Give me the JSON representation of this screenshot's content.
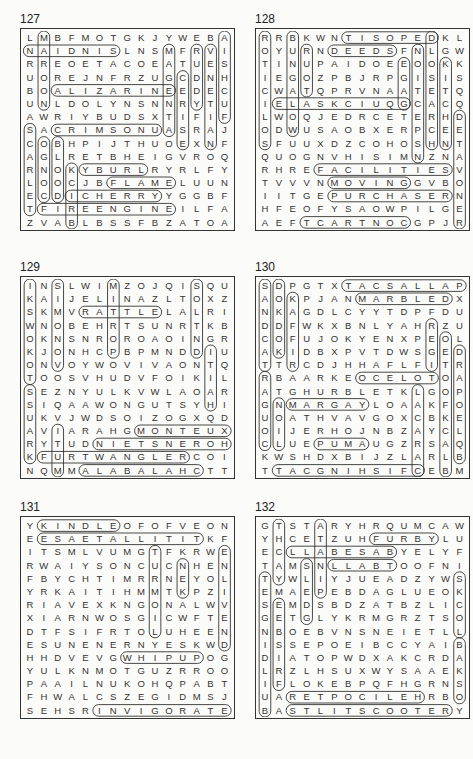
{
  "puzzles": [
    {
      "number": "127",
      "grid": [
        "LMBFMOTGKJYWEBA",
        "NAIDNISLNSMFRVI",
        "RREOETACOEATUES",
        "UOREJNFRZUGCDNH",
        "BOALIZARINEEDEC",
        "UNLDOLYNSNNRYTU",
        "AWRIYBUDSXTIFIF",
        "SACRIMSONUASRAJ",
        "COBHPIJTHUOEXNF",
        "AGLRETBHEIGVROQ",
        "RNOKYBURLRYRLFY",
        "LOOCJBFLAMELUUN",
        "ECDICHERRYYGGBF",
        "TFIREENGINEILFA",
        "ZVABLBSSFBZATOA"
      ],
      "words": [
        {
          "r1": 1,
          "c1": 0,
          "r2": 1,
          "c2": 6
        },
        {
          "r1": 4,
          "c1": 2,
          "r2": 4,
          "c2": 10
        },
        {
          "r1": 7,
          "c1": 2,
          "r2": 7,
          "c2": 9
        },
        {
          "r1": 12,
          "c1": 3,
          "r2": 12,
          "c2": 9
        },
        {
          "r1": 11,
          "c1": 6,
          "r2": 11,
          "c2": 10
        },
        {
          "r1": 13,
          "c1": 1,
          "r2": 13,
          "c2": 10
        },
        {
          "r1": 10,
          "c1": 4,
          "r2": 10,
          "c2": 8
        },
        {
          "r1": 0,
          "c1": 1,
          "r2": 5,
          "c2": 1
        },
        {
          "r1": 1,
          "c1": 10,
          "r2": 7,
          "c2": 10
        },
        {
          "r1": 1,
          "c1": 12,
          "r2": 5,
          "c2": 12
        },
        {
          "r1": 1,
          "c1": 13,
          "r2": 8,
          "c2": 13
        },
        {
          "r1": 0,
          "c1": 14,
          "r2": 6,
          "c2": 14
        },
        {
          "r1": 7,
          "c1": 0,
          "r2": 13,
          "c2": 0
        },
        {
          "r1": 8,
          "c1": 2,
          "r2": 12,
          "c2": 2
        },
        {
          "r1": 10,
          "c1": 3,
          "r2": 14,
          "c2": 3
        },
        {
          "r1": 3,
          "c1": 11,
          "r2": 8,
          "c2": 11
        },
        {
          "r1": 8,
          "c1": 1,
          "r2": 12,
          "c2": 1
        }
      ]
    },
    {
      "number": "128",
      "grid": [
        "RRBKWNTISOPEDKL",
        "OYURNDEEDSFNLGW",
        "TINUPAIDOEEOOKK",
        "IEGOZPBJRPGISIS",
        "CWATQPRVNAATETQ",
        "IELASKCIUQGCACQ",
        "LWOQJEDRCETERHD",
        "ODWUSAOBXERPCEE",
        "SFUUXDZCOHOSHNT",
        "QUOGNVHISIMNZNA",
        "RHREFACILITIESV",
        "TVVVNMOVINGGVBO",
        "IITGEPURCHASERN",
        "HFEOFYSAOWPILGE",
        "AEFTCARTNOCGPJR"
      ],
      "words": [
        {
          "r1": 0,
          "c1": 6,
          "r2": 0,
          "c2": 12
        },
        {
          "r1": 1,
          "c1": 5,
          "r2": 1,
          "c2": 9
        },
        {
          "r1": 5,
          "c1": 1,
          "r2": 5,
          "c2": 10
        },
        {
          "r1": 10,
          "c1": 4,
          "r2": 10,
          "c2": 13
        },
        {
          "r1": 11,
          "c1": 5,
          "r2": 11,
          "c2": 10
        },
        {
          "r1": 12,
          "c1": 5,
          "r2": 12,
          "c2": 13
        },
        {
          "r1": 14,
          "c1": 3,
          "r2": 14,
          "c2": 10
        },
        {
          "r1": 0,
          "c1": 0,
          "r2": 8,
          "c2": 0
        },
        {
          "r1": 0,
          "c1": 2,
          "r2": 7,
          "c2": 2
        },
        {
          "r1": 1,
          "c1": 3,
          "r2": 4,
          "c2": 3
        },
        {
          "r1": 1,
          "c1": 11,
          "r2": 9,
          "c2": 11
        },
        {
          "r1": 0,
          "c1": 12,
          "r2": 8,
          "c2": 12
        },
        {
          "r1": 2,
          "c1": 13,
          "r2": 8,
          "c2": 13
        },
        {
          "r1": 6,
          "c1": 14,
          "r2": 14,
          "c2": 14
        },
        {
          "r1": 2,
          "c1": 10,
          "r2": 5,
          "c2": 10
        }
      ]
    },
    {
      "number": "129",
      "grid": [
        "INSLWIMZOJQISQU",
        "KAIJELINAZLTOXZ",
        "SKMVRATTLELALRI",
        "WNOBEHRTSUNRTKB",
        "OKNSNROROAOINGR",
        "KJONHCPBPMNDDIU",
        "ONVOYWOVIVAONTQ",
        "TOOSVHUDVFOIKIL",
        "SEZNYULKVWLAOAR",
        "SIQAAWONGUTSYHI",
        "UKVJWDSOIZOGXQD",
        "AVIARAHGMONTEUX",
        "RYTUDNIETSNEROH",
        "KFURTWANGLERCOI",
        "NQMMALABALAHCTT"
      ],
      "words": [
        {
          "r1": 2,
          "c1": 4,
          "r2": 2,
          "c2": 9
        },
        {
          "r1": 11,
          "c1": 8,
          "r2": 11,
          "c2": 14
        },
        {
          "r1": 12,
          "c1": 5,
          "r2": 12,
          "c2": 14
        },
        {
          "r1": 13,
          "c1": 1,
          "r2": 13,
          "c2": 11
        },
        {
          "r1": 14,
          "c1": 4,
          "r2": 14,
          "c2": 12
        },
        {
          "r1": 0,
          "c1": 0,
          "r2": 7,
          "c2": 0
        },
        {
          "r1": 0,
          "c1": 6,
          "r2": 5,
          "c2": 6
        },
        {
          "r1": 0,
          "c1": 12,
          "r2": 5,
          "c2": 12
        },
        {
          "r1": 0,
          "c1": 2,
          "r2": 6,
          "c2": 2
        },
        {
          "r1": 11,
          "c1": 2,
          "r2": 14,
          "c2": 2
        },
        {
          "r1": 5,
          "c1": 13,
          "r2": 9,
          "c2": 13
        },
        {
          "r1": 8,
          "c1": 0,
          "r2": 13,
          "c2": 0
        }
      ]
    },
    {
      "number": "130",
      "grid": [
        "SDPGTXTACSALLAP",
        "AOKPJANMARBLEDX",
        "NKAGDLCYYTDPFDU",
        "DDFWKXBNLYAHRZU",
        "COFUJOKYENXPEOL",
        "AKIDBXPVTDWSGED",
        "TTRCDJHHAFLFITR",
        "RBAARKEOCELOTOA",
        "ATGHURBLETKLGOP",
        "GNMARGAYLOAAKFO",
        "UOATHVAVGOXCBKE",
        "OIJERHOJNBZAYCL",
        "CLUEPUMAUGZRSAQ",
        "KWSHDXBIJZLARLB",
        "TTACGNIHSIFCEBM"
      ],
      "words": [
        {
          "r1": 0,
          "c1": 6,
          "r2": 0,
          "c2": 14
        },
        {
          "r1": 1,
          "c1": 7,
          "r2": 1,
          "c2": 13
        },
        {
          "r1": 7,
          "c1": 7,
          "r2": 7,
          "c2": 12
        },
        {
          "r1": 9,
          "c1": 2,
          "r2": 9,
          "c2": 7
        },
        {
          "r1": 12,
          "c1": 4,
          "r2": 12,
          "c2": 7
        },
        {
          "r1": 14,
          "c1": 1,
          "r2": 14,
          "c2": 11
        },
        {
          "r1": 0,
          "c1": 0,
          "r2": 6,
          "c2": 0
        },
        {
          "r1": 0,
          "c1": 1,
          "r2": 5,
          "c2": 1
        },
        {
          "r1": 1,
          "c1": 2,
          "r2": 6,
          "c2": 2
        },
        {
          "r1": 7,
          "c1": 0,
          "r2": 12,
          "c2": 0
        },
        {
          "r1": 9,
          "c1": 1,
          "r2": 12,
          "c2": 1
        },
        {
          "r1": 3,
          "c1": 12,
          "r2": 6,
          "c2": 12
        },
        {
          "r1": 4,
          "c1": 13,
          "r2": 14,
          "c2": 13
        },
        {
          "r1": 5,
          "c1": 14,
          "r2": 13,
          "c2": 14
        },
        {
          "r1": 8,
          "c1": 11,
          "r2": 14,
          "c2": 11
        }
      ]
    },
    {
      "number": "131",
      "grid": [
        "YKINDLEOFOFVEON",
        "EESAETALLITITKF",
        "ITSMLVUMGTFKRWE",
        "RWAIYSONCUCNHEN",
        "FBYCHTIMRRNEYOL",
        "YRKAITIHMMTKPZI",
        "RIAVEXKNGONALWV",
        "XIARNWOSGICWFTE",
        "DTFSIFRTOLUHEEN",
        "ESUNENERNYESKWD",
        "HHDVEVGWHIPUPOG",
        "YULKNMOTGUZRROO",
        "PAAILNUKOHQPABT",
        "FHWALCSZEGIDMSJ",
        "SEHSRINVIGORATE"
      ],
      "words": [
        {
          "r1": 0,
          "c1": 1,
          "r2": 0,
          "c2": 6
        },
        {
          "r1": 1,
          "c1": 1,
          "r2": 1,
          "c2": 12
        },
        {
          "r1": 10,
          "c1": 7,
          "r2": 10,
          "c2": 12
        },
        {
          "r1": 14,
          "c1": 5,
          "r2": 14,
          "c2": 14
        },
        {
          "r1": 2,
          "c1": 14,
          "r2": 9,
          "c2": 14
        },
        {
          "r1": 2,
          "c1": 9,
          "r2": 8,
          "c2": 9
        },
        {
          "r1": 3,
          "c1": 11,
          "r2": 5,
          "c2": 11
        }
      ]
    },
    {
      "number": "132",
      "grid": [
        "GTSTARYHRQUMCAW",
        "YHCETZUHFURBYLU",
        "ECLLABESABYELYF",
        "TAMSNLLABTOOFNI",
        "TYWLIYJUEADZYWS",
        "EMAEPEBDAGLUEOK",
        "SEMDSBDZATBZLIC",
        "GETGLYKRMGRZTSO",
        "NBOEBVNSNEIETLL",
        "ISSEPOEIBCCYAIB",
        "DIATOPWDXAKCRDA",
        "LRZLHSUXWYSAAEK",
        "IFLOKEBPQFHGRNS",
        "UARETPOCILEHRBO",
        "BASTLITSCOOTERY"
      ],
      "words": [
        {
          "r1": 1,
          "c1": 8,
          "r2": 1,
          "c2": 12
        },
        {
          "r1": 2,
          "c1": 2,
          "r2": 2,
          "c2": 9
        },
        {
          "r1": 3,
          "c1": 5,
          "r2": 3,
          "c2": 9
        },
        {
          "r1": 13,
          "c1": 2,
          "r2": 13,
          "c2": 11
        },
        {
          "r1": 14,
          "c1": 2,
          "r2": 14,
          "c2": 13
        },
        {
          "r1": 0,
          "c1": 1,
          "r2": 4,
          "c2": 1
        },
        {
          "r1": 0,
          "c1": 4,
          "r2": 5,
          "c2": 4
        },
        {
          "r1": 3,
          "c1": 3,
          "r2": 7,
          "c2": 3
        },
        {
          "r1": 4,
          "c1": 0,
          "r2": 14,
          "c2": 0
        },
        {
          "r1": 4,
          "c1": 14,
          "r2": 8,
          "c2": 14
        },
        {
          "r1": 6,
          "c1": 1,
          "r2": 12,
          "c2": 1
        },
        {
          "r1": 9,
          "c1": 14,
          "r2": 13,
          "c2": 14
        }
      ]
    }
  ]
}
